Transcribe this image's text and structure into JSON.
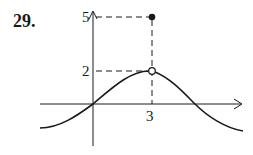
{
  "problem": {
    "number": "29."
  },
  "graph": {
    "y_labels": {
      "five": "5",
      "two": "2"
    },
    "x_labels": {
      "three": "3"
    },
    "colors": {
      "stroke": "#1a1a1a",
      "background": "#ffffff"
    },
    "points": {
      "filled": {
        "x": 3,
        "y": 5,
        "style": "filled"
      },
      "open": {
        "x": 3,
        "y": 2,
        "style": "open"
      }
    },
    "curve_description": "Sinusoidal wave passing through origin, rising to hole at (3,2), then falling and crossing x-axis; value at x=3 is defined as 5"
  }
}
